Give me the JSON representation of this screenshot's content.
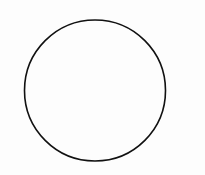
{
  "diagram": {
    "background": "#fdfdfd",
    "shapes": [
      {
        "type": "circle",
        "cx": 95,
        "cy": 90.5,
        "r": 70.5,
        "stroke": "#111111",
        "stroke_width": 1.6,
        "fill": "none"
      }
    ]
  }
}
